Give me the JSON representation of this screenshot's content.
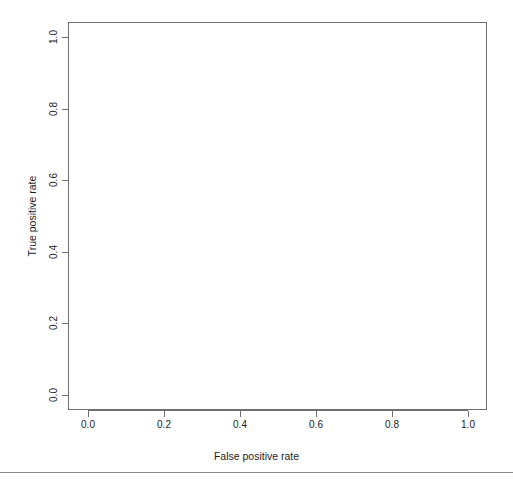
{
  "chart_data": {
    "type": "line",
    "title": "",
    "xlabel": "False positive rate",
    "ylabel": "True positive rate",
    "xlim": [
      -0.04,
      1.04
    ],
    "ylim": [
      -0.04,
      1.04
    ],
    "xticks": [
      "0.0",
      "0.2",
      "0.4",
      "0.6",
      "0.8",
      "1.0"
    ],
    "yticks": [
      "0.0",
      "0.2",
      "0.4",
      "0.6",
      "0.8",
      "1.0"
    ],
    "xtick_values": [
      0.0,
      0.2,
      0.4,
      0.6,
      0.8,
      1.0
    ],
    "ytick_values": [
      0.0,
      0.2,
      0.4,
      0.6,
      0.8,
      1.0
    ],
    "grid": false,
    "legend": "none",
    "series": [
      {
        "name": "ROC curve",
        "x": [],
        "y": []
      }
    ],
    "note": "Empty ROC axes — no curve rendered in plot region"
  },
  "figure": {
    "title": "",
    "x_axis_title": "False positive rate",
    "y_axis_title": "True positive rate"
  }
}
